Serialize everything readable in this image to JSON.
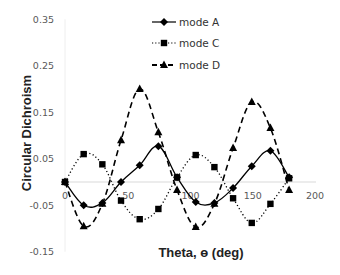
{
  "chart_data": {
    "type": "line",
    "title": "",
    "xlabel": "Theta, ɵ (deg)",
    "ylabel": "Circular Dichroism",
    "xlim": [
      0,
      200
    ],
    "ylim": [
      -0.15,
      0.35
    ],
    "x_ticks": [
      "0",
      "50",
      "100",
      "150",
      "200"
    ],
    "y_ticks": [
      "0.35",
      "0.25",
      "0.15",
      "0.05",
      "-0.05",
      "-0.15"
    ],
    "grid": false,
    "legend_position": "top-right",
    "x": [
      0,
      15,
      30,
      45,
      60,
      75,
      90,
      105,
      120,
      135,
      150,
      165,
      180
    ],
    "series": [
      {
        "name": "mode  A",
        "marker": "diamond",
        "line": "solid",
        "values": [
          0.0,
          -0.05,
          -0.045,
          0.0,
          0.036,
          0.077,
          0.01,
          -0.043,
          -0.045,
          -0.013,
          0.034,
          0.067,
          0.01
        ]
      },
      {
        "name": "mode  C",
        "marker": "square",
        "line": "dotted",
        "values": [
          0.0,
          0.06,
          0.038,
          -0.04,
          -0.08,
          -0.058,
          0.01,
          0.058,
          0.032,
          -0.035,
          -0.088,
          -0.047,
          0.008
        ]
      },
      {
        "name": "mode  D",
        "marker": "triangle",
        "line": "dashed",
        "values": [
          0.0,
          -0.095,
          -0.047,
          0.09,
          0.2,
          0.107,
          -0.017,
          -0.097,
          -0.047,
          0.073,
          0.172,
          0.116,
          -0.017
        ]
      }
    ]
  },
  "colors": {
    "series": "#000000",
    "zero_line": "#d9d9d9",
    "tick_text": "#595959"
  }
}
